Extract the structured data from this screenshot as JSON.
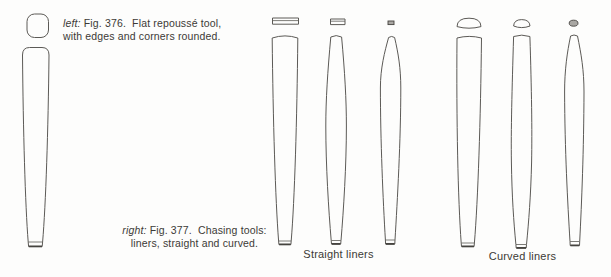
{
  "page": {
    "background": "#fdfdfc"
  },
  "colors": {
    "line": "#5c5a56",
    "line_dark": "#45433f",
    "fill_gray": "#a9a7a3",
    "text": "#3c3a36"
  },
  "captions": {
    "fig376": {
      "lead": "left:",
      "line1_rest": " Fig. 376.  Flat repoussé tool,",
      "line2": "with edges and corners rounded."
    },
    "fig377": {
      "lead": "right:",
      "line1_rest": " Fig. 377.  Chasing tools:",
      "line2": "liners, straight and curved."
    }
  },
  "labels": {
    "straight_liners": "Straight liners",
    "curved_liners": "Curved liners"
  }
}
